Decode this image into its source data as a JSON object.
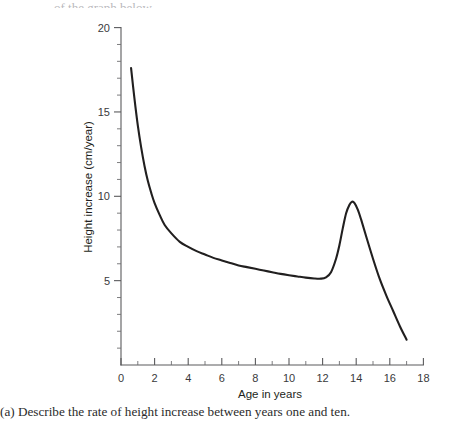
{
  "caption": {
    "text": "(a) Describe the rate of height increase between years one and ten."
  },
  "top_fragment": {
    "text": "of the graph below."
  },
  "chart_data": {
    "type": "line",
    "title": "",
    "subtitle": "",
    "xlabel": "Age in years",
    "ylabel": "Height increase (cm/year)",
    "xlim": [
      0,
      18
    ],
    "ylim": [
      0,
      20
    ],
    "xticks": [
      0,
      2,
      4,
      6,
      8,
      10,
      12,
      14,
      16,
      18
    ],
    "xticklabels": [
      "0",
      "2",
      "4",
      "6",
      "8",
      "10",
      "12",
      "14",
      "16",
      "18"
    ],
    "x_minor_step": 1,
    "yticks": [
      5,
      10,
      15,
      20
    ],
    "yticklabels": [
      "5",
      "10",
      "15",
      "20"
    ],
    "y_minor_step": 1,
    "grid": false,
    "legend": "none",
    "line_color": "#211f1f",
    "axis_color": "#5a5a5c",
    "background": "#ffffff",
    "series": [
      {
        "name": "Height velocity",
        "x": [
          0.6,
          0.8,
          1.0,
          1.2,
          1.4,
          1.6,
          1.8,
          2.0,
          2.3,
          2.6,
          3.0,
          3.5,
          4.0,
          4.5,
          5.0,
          5.5,
          6.0,
          6.5,
          7.0,
          7.5,
          8.0,
          8.5,
          9.0,
          9.5,
          10.0,
          10.5,
          11.0,
          11.5,
          11.9,
          12.2,
          12.5,
          12.8,
          13.0,
          13.2,
          13.4,
          13.6,
          13.75,
          13.9,
          14.1,
          14.3,
          14.6,
          15.0,
          15.4,
          15.8,
          16.2,
          16.6,
          17.0
        ],
        "y": [
          17.6,
          15.8,
          14.2,
          12.9,
          11.8,
          10.9,
          10.2,
          9.6,
          8.9,
          8.3,
          7.8,
          7.3,
          7.0,
          6.75,
          6.55,
          6.35,
          6.2,
          6.05,
          5.9,
          5.8,
          5.7,
          5.6,
          5.5,
          5.4,
          5.32,
          5.25,
          5.18,
          5.13,
          5.12,
          5.2,
          5.5,
          6.3,
          7.1,
          8.1,
          9.0,
          9.5,
          9.68,
          9.6,
          9.2,
          8.6,
          7.6,
          6.3,
          5.1,
          4.1,
          3.2,
          2.3,
          1.5
        ]
      }
    ],
    "annotations": [
      {
        "label": "peak-growth-spurt",
        "x": 13.75,
        "y": 9.7
      },
      {
        "label": "pre-pubertal-minimum",
        "x": 11.9,
        "y": 5.1
      },
      {
        "label": "infancy-maximum",
        "x": 0.6,
        "y": 17.6
      }
    ]
  }
}
